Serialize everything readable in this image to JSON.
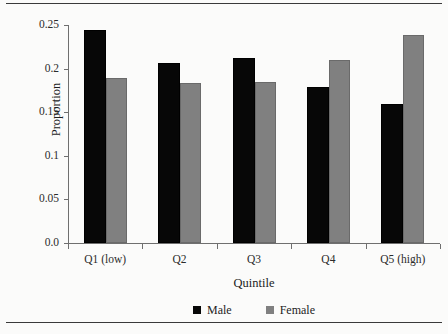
{
  "chart_data": {
    "type": "bar",
    "title": "",
    "xlabel": "Quintile",
    "ylabel": "Proportion",
    "categories": [
      "Q1 (low)",
      "Q2",
      "Q3",
      "Q4",
      "Q5 (high)"
    ],
    "series": [
      {
        "name": "Male",
        "color": "#070707",
        "values": [
          0.244,
          0.207,
          0.212,
          0.179,
          0.159
        ]
      },
      {
        "name": "Female",
        "color": "#808080",
        "values": [
          0.189,
          0.183,
          0.185,
          0.21,
          0.238
        ]
      }
    ],
    "ylim": [
      0.0,
      0.25
    ],
    "ytick_labels": [
      "0.0",
      "0.05",
      "0.1",
      "0.15",
      "0.2",
      "0.25"
    ],
    "ytick_values": [
      0.0,
      0.05,
      0.1,
      0.15,
      0.2,
      0.25
    ],
    "grid": false,
    "legend_position": "bottom"
  },
  "legend": {
    "items": [
      {
        "label": "Male"
      },
      {
        "label": "Female"
      }
    ]
  }
}
